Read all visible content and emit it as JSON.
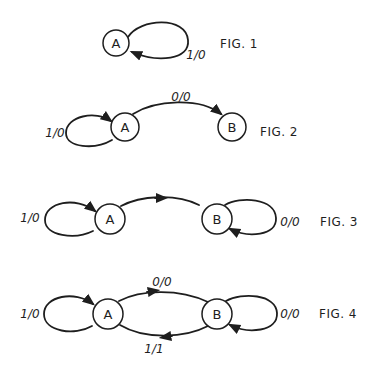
{
  "figures": [
    {
      "label": "FIG. 1",
      "states": [
        {
          "name": "A"
        }
      ],
      "transitions": [
        {
          "from": "A",
          "to": "A",
          "label": "1/0"
        }
      ]
    },
    {
      "label": "FIG. 2",
      "states": [
        {
          "name": "A"
        },
        {
          "name": "B"
        }
      ],
      "transitions": [
        {
          "from": "A",
          "to": "A",
          "label": "1/0"
        },
        {
          "from": "A",
          "to": "B",
          "label": "0/0"
        }
      ]
    },
    {
      "label": "FIG. 3",
      "states": [
        {
          "name": "A"
        },
        {
          "name": "B"
        }
      ],
      "transitions": [
        {
          "from": "A",
          "to": "A",
          "label": "1/0"
        },
        {
          "from": "A",
          "to": "B",
          "label": ""
        },
        {
          "from": "B",
          "to": "B",
          "label": "0/0"
        }
      ]
    },
    {
      "label": "FIG. 4",
      "states": [
        {
          "name": "A"
        },
        {
          "name": "B"
        }
      ],
      "transitions": [
        {
          "from": "A",
          "to": "A",
          "label": "1/0"
        },
        {
          "from": "A",
          "to": "B",
          "label": "0/0"
        },
        {
          "from": "B",
          "to": "B",
          "label": "0/0"
        },
        {
          "from": "B",
          "to": "A",
          "label": "1/1"
        }
      ]
    }
  ]
}
